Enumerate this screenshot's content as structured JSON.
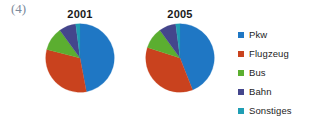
{
  "figure": {
    "number_label": "(4)",
    "number_color": "#7b8a9c"
  },
  "legend": {
    "position": "right",
    "items": [
      {
        "label": "Pkw",
        "color": "#1f77c4"
      },
      {
        "label": "Flugzeug",
        "color": "#c9421e"
      },
      {
        "label": "Bus",
        "color": "#5bae30"
      },
      {
        "label": "Bahn",
        "color": "#44468c"
      },
      {
        "label": "Sonstiges",
        "color": "#1f9eb4"
      }
    ]
  },
  "charts": [
    {
      "title": "2001"
    },
    {
      "title": "2005"
    }
  ],
  "chart_data": [
    {
      "type": "pie",
      "title": "2001",
      "categories": [
        "Pkw",
        "Flugzeug",
        "Bus",
        "Bahn",
        "Sonstiges"
      ],
      "values": [
        47,
        32,
        11,
        8,
        2
      ],
      "colors": [
        "#1f77c4",
        "#c9421e",
        "#5bae30",
        "#44468c",
        "#1f9eb4"
      ],
      "start_angle": 0,
      "direction": "clockwise",
      "legend": "right",
      "xlabel": "",
      "ylabel": ""
    },
    {
      "type": "pie",
      "title": "2005",
      "categories": [
        "Pkw",
        "Flugzeug",
        "Bus",
        "Bahn",
        "Sonstiges"
      ],
      "values": [
        44,
        36,
        10,
        8,
        2
      ],
      "colors": [
        "#1f77c4",
        "#c9421e",
        "#5bae30",
        "#44468c",
        "#1f9eb4"
      ],
      "start_angle": 0,
      "direction": "clockwise",
      "legend": "right",
      "xlabel": "",
      "ylabel": ""
    }
  ]
}
